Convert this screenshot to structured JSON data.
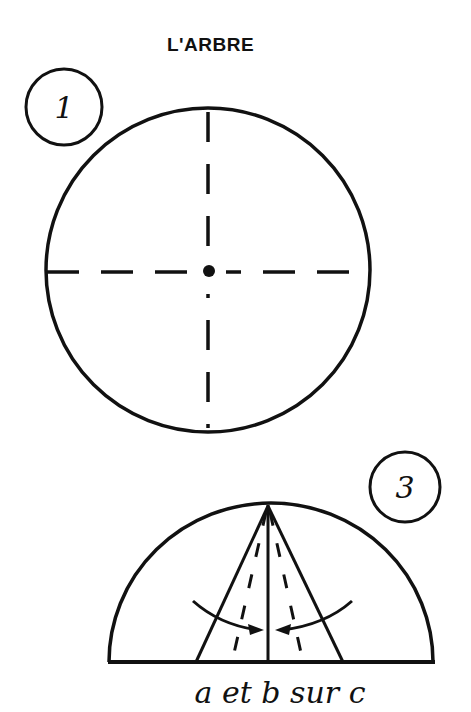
{
  "title": "L'ARBRE",
  "steps": [
    {
      "number": "1",
      "figure": "circle with dashed cross and center point"
    },
    {
      "number": "3",
      "figure": "semicircle with folds"
    }
  ],
  "caption": "a et b sur c",
  "colors": {
    "ink": "#111111",
    "background": "#ffffff"
  }
}
